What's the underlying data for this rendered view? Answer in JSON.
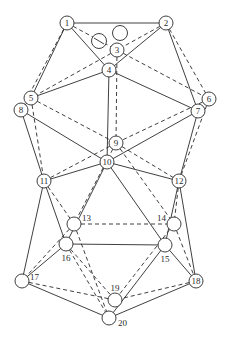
{
  "diagram": {
    "type": "graph",
    "nodes": [
      {
        "id": "1",
        "label": "1"
      },
      {
        "id": "2",
        "label": "2"
      },
      {
        "id": "3",
        "label": "3"
      },
      {
        "id": "4",
        "label": "4"
      },
      {
        "id": "5",
        "label": "5"
      },
      {
        "id": "6",
        "label": "6"
      },
      {
        "id": "7",
        "label": "7"
      },
      {
        "id": "8",
        "label": "8"
      },
      {
        "id": "9",
        "label": "9"
      },
      {
        "id": "10",
        "label": "10"
      },
      {
        "id": "11",
        "label": "11"
      },
      {
        "id": "12",
        "label": "12"
      },
      {
        "id": "13",
        "label": "13"
      },
      {
        "id": "14",
        "label": "14"
      },
      {
        "id": "15",
        "label": "15"
      },
      {
        "id": "16",
        "label": "16"
      },
      {
        "id": "17",
        "label": "17"
      },
      {
        "id": "18",
        "label": "18"
      },
      {
        "id": "19",
        "label": "19"
      },
      {
        "id": "20",
        "label": "20"
      },
      {
        "id": "u1",
        "label": ""
      },
      {
        "id": "u2",
        "label": ""
      }
    ],
    "solid_edges": [
      [
        "1",
        "2"
      ],
      [
        "1",
        "4"
      ],
      [
        "1",
        "5"
      ],
      [
        "2",
        "4"
      ],
      [
        "2",
        "7"
      ],
      [
        "4",
        "5"
      ],
      [
        "4",
        "7"
      ],
      [
        "4",
        "10"
      ],
      [
        "5",
        "8"
      ],
      [
        "8",
        "10"
      ],
      [
        "7",
        "10"
      ],
      [
        "8",
        "11"
      ],
      [
        "7",
        "12"
      ],
      [
        "10",
        "11"
      ],
      [
        "10",
        "12"
      ],
      [
        "10",
        "16"
      ],
      [
        "10",
        "15"
      ],
      [
        "11",
        "16"
      ],
      [
        "11",
        "17"
      ],
      [
        "12",
        "15"
      ],
      [
        "12",
        "18"
      ],
      [
        "16",
        "15"
      ],
      [
        "16",
        "17"
      ],
      [
        "15",
        "18"
      ],
      [
        "15",
        "20"
      ],
      [
        "17",
        "20"
      ],
      [
        "18",
        "20"
      ]
    ],
    "dashed_edges": [
      [
        "1",
        "3"
      ],
      [
        "1",
        "8"
      ],
      [
        "2",
        "3"
      ],
      [
        "2",
        "6"
      ],
      [
        "3",
        "5"
      ],
      [
        "3",
        "6"
      ],
      [
        "3",
        "9"
      ],
      [
        "5",
        "9"
      ],
      [
        "6",
        "9"
      ],
      [
        "5",
        "11"
      ],
      [
        "6",
        "12"
      ],
      [
        "9",
        "11"
      ],
      [
        "9",
        "12"
      ],
      [
        "9",
        "13"
      ],
      [
        "9",
        "14"
      ],
      [
        "11",
        "13"
      ],
      [
        "12",
        "14"
      ],
      [
        "13",
        "14"
      ],
      [
        "13",
        "17"
      ],
      [
        "13",
        "20"
      ],
      [
        "14",
        "18"
      ],
      [
        "14",
        "19"
      ],
      [
        "16",
        "20"
      ],
      [
        "17",
        "19"
      ],
      [
        "18",
        "19"
      ],
      [
        "16",
        "19"
      ]
    ]
  }
}
